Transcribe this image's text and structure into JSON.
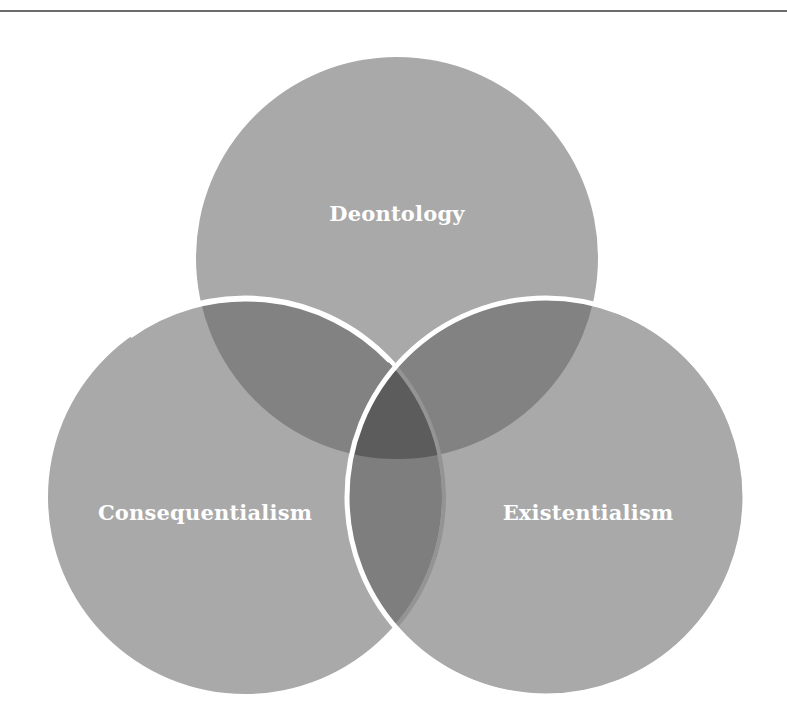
{
  "diagram": {
    "type": "venn",
    "sets": [
      {
        "id": "top",
        "label": "Deontology",
        "cx": 397,
        "cy": 258,
        "r": 201
      },
      {
        "id": "left",
        "label": "Consequentialism",
        "cx": 245,
        "cy": 497,
        "r": 197
      },
      {
        "id": "right",
        "label": "Existentialism",
        "cx": 546,
        "cy": 497,
        "r": 197
      }
    ],
    "colors": {
      "circle_fill": "#8c8c8c",
      "circle_fill_opacity": 0.72,
      "outline": "#ffffff",
      "label_text": "#ffffff",
      "rule": "#6b6b6b",
      "background": "#ffffff"
    }
  },
  "labels": {
    "top": "Deontology",
    "left": "Consequentialism",
    "right": "Existentialism"
  }
}
